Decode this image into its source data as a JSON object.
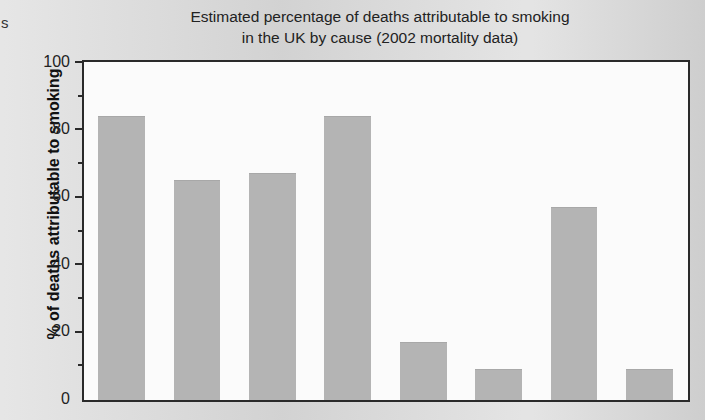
{
  "page": {
    "stray_text": "s"
  },
  "chart_data": {
    "type": "bar",
    "title": "Estimated percentage of deaths attributable to smoking in the UK by cause (2002 mortality data)",
    "title_line1": "Estimated percentage of deaths attributable to smoking",
    "title_line2": "in the UK by cause (2002 mortality data)",
    "xlabel": "",
    "ylabel": "% of deaths attributable to smoking",
    "ylim": [
      0,
      100
    ],
    "ytick_labels": [
      "0",
      "20",
      "40",
      "60",
      "80",
      "100"
    ],
    "ytick_values": [
      0,
      20,
      40,
      60,
      80,
      100
    ],
    "minor_tick_values": [
      10,
      30,
      50,
      70,
      90
    ],
    "grid": false,
    "legend": false,
    "bar_color": "#b4b4b4",
    "axis_color": "#2a2a2a",
    "plot_background": "#fbfbfb",
    "page_background": "#d9d9d9",
    "categories": [
      "Lung cancer",
      "Upper respiratory cancer",
      "Oesophageal cancer",
      "Chronic obstructive lung disease",
      "Ischaemic heart disease",
      "Cerebrovascular disease (stroke)",
      "Aortic aneurysm",
      "Atherosclerosis"
    ],
    "values": [
      84,
      65,
      67,
      84,
      17,
      9,
      57,
      9
    ]
  }
}
